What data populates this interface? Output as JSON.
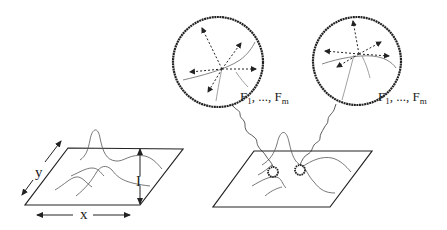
{
  "figure": {
    "left_panel": {
      "description": "3D intensity surface over image plane",
      "axis_labels": {
        "x": "x",
        "y": "y",
        "intensity": "I"
      }
    },
    "right_panel": {
      "description": "Surface with two selected points, each magnified into a circle showing local feature vectors",
      "magnifiers": [
        {
          "label_main": "F",
          "label_sub1": "1",
          "label_sep": ", ..., ",
          "label_main2": "F",
          "label_sub2": "m"
        },
        {
          "label_main": "F",
          "label_sub1": "1",
          "label_sep": ", ..., ",
          "label_main2": "F",
          "label_sub2": "m"
        }
      ]
    },
    "colors": {
      "stroke": "#222222",
      "thin": "#555555",
      "background": "#ffffff"
    }
  }
}
